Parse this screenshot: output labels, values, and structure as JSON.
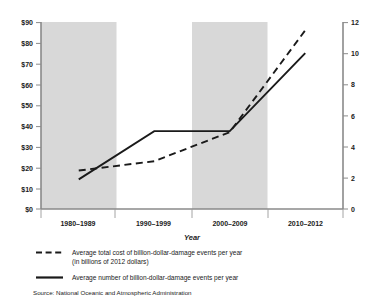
{
  "chart_data": {
    "type": "line",
    "title": "",
    "subtitle": "",
    "xlabel": "Year",
    "categories": [
      "1980–1989",
      "1990–1999",
      "2000–2009",
      "2010–2012"
    ],
    "grid": false,
    "legend_position": "below-plot-left",
    "shaded_bands": [
      {
        "category": "1980–1989",
        "color": "#d8d8d8"
      },
      {
        "category": "2000–2009",
        "color": "#d8d8d8"
      }
    ],
    "axes": {
      "left": {
        "label": "",
        "ylim": [
          0,
          90
        ],
        "ticks": [
          0,
          10,
          20,
          30,
          40,
          50,
          60,
          70,
          80,
          90
        ],
        "tick_labels": [
          "$0",
          "$10",
          "$20",
          "$30",
          "$40",
          "$50",
          "$60",
          "$70",
          "$80",
          "$90"
        ],
        "series": "Average total cost of billion-dollar-damage events per year (in billions of 2012 dollars)"
      },
      "right": {
        "label": "",
        "ylim": [
          0,
          12
        ],
        "ticks": [
          0,
          2,
          4,
          6,
          8,
          10,
          12
        ],
        "tick_labels": [
          "0",
          "2",
          "4",
          "6",
          "8",
          "10",
          "12"
        ],
        "series": "Average number of billion-dollar-damage events per year"
      }
    },
    "series": [
      {
        "name": "Average total cost of billion-dollar-damage events per year (in billions of 2012 dollars)",
        "legend_label_line1": "Average total cost of billion-dollar-damage events per year",
        "legend_label_line2": "(in billions of 2012 dollars)",
        "axis": "left",
        "style": "dashed",
        "color": "#1a1a1a",
        "values": [
          18.5,
          23.0,
          37.0,
          86.0
        ],
        "units": "billions of 2012 dollars"
      },
      {
        "name": "Average number of billion-dollar-damage events per year",
        "legend_label_line1": "Average number of billion-dollar-damage events per year",
        "axis": "right",
        "style": "solid",
        "color": "#1a1a1a",
        "values": [
          1.9,
          5.0,
          5.0,
          10.0
        ],
        "units": "events per year"
      }
    ],
    "source": "Source: National Oceanic and Atmospheric Administration"
  }
}
